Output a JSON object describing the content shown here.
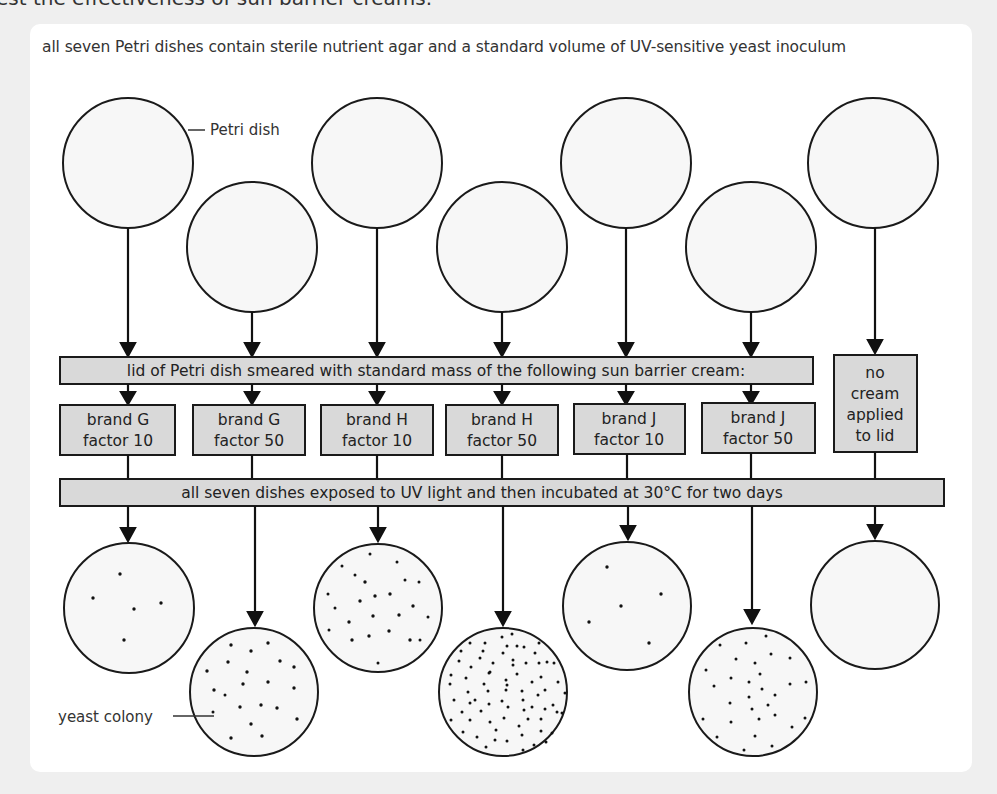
{
  "heading_cut": "est the effectiveness of sun barrier creams.",
  "intro": "all seven Petri dishes contain sterile nutrient agar and a standard volume of UV-sensitive yeast inoculum",
  "labels": {
    "petri_dish": "Petri dish",
    "yeast_colony": "yeast colony"
  },
  "step1_bar": "lid of Petri dish smeared with standard mass of the following sun barrier cream:",
  "step2_bar": "all seven dishes exposed to UV light and then incubated at 30°C for two days",
  "treatments": [
    {
      "line1": "brand G",
      "line2": "factor 10"
    },
    {
      "line1": "brand G",
      "line2": "factor 50"
    },
    {
      "line1": "brand H",
      "line2": "factor 10"
    },
    {
      "line1": "brand H",
      "line2": "factor 50"
    },
    {
      "line1": "brand J",
      "line2": "factor 10"
    },
    {
      "line1": "brand J",
      "line2": "factor 50"
    },
    {
      "line1": "no",
      "line2": "cream",
      "line3": "applied",
      "line4": "to lid"
    }
  ],
  "results": [
    {
      "treatment": "brand G factor 10",
      "colonies_shown": 5
    },
    {
      "treatment": "brand G factor 50",
      "colonies_shown": 21
    },
    {
      "treatment": "brand H factor 10",
      "colonies_shown": 24
    },
    {
      "treatment": "brand H factor 50",
      "colonies_shown": 75
    },
    {
      "treatment": "brand J factor 10",
      "colonies_shown": 5
    },
    {
      "treatment": "brand J factor 50",
      "colonies_shown": 30
    },
    {
      "treatment": "no cream applied to lid",
      "colonies_shown": 0
    }
  ],
  "colors": {
    "background": "#efefef",
    "panel": "#ffffff",
    "box_fill": "#d9d9d9",
    "dish_fill": "#f7f7f7",
    "stroke": "#1a1a1a"
  }
}
